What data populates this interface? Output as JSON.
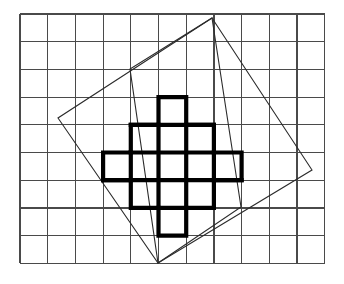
{
  "figure": {
    "background_color": "#ffffff",
    "width": 344,
    "height": 284
  },
  "grid": {
    "label": "square-lattice-grid",
    "color": "#4a4a4a",
    "stroke_width": 1.2,
    "x_start": 20,
    "y_start": 14,
    "cell_size": 27.7,
    "columns": 11,
    "rows": 9,
    "x_lines": [
      20,
      47.7,
      75.4,
      103.1,
      130.8,
      158.5,
      186.2,
      213.9,
      241.6,
      269.3,
      297.0,
      324.7
    ],
    "y_lines": [
      14,
      41.7,
      69.4,
      97.1,
      124.8,
      152.5,
      180.2,
      207.9,
      235.6,
      263.3
    ]
  },
  "outer_square": {
    "label": "large-rotated-square",
    "color": "#2b2b2b",
    "stroke_width": 1.1,
    "vertices": [
      {
        "name": "top",
        "x": 212,
        "y": 18
      },
      {
        "name": "right",
        "x": 312,
        "y": 170
      },
      {
        "name": "bottom",
        "x": 158,
        "y": 263
      },
      {
        "name": "left",
        "x": 58,
        "y": 118
      }
    ],
    "points_attr": "212,18 312,170 158,263 58,118"
  },
  "inner_square": {
    "label": "small-rotated-square",
    "color": "#2b2b2b",
    "stroke_width": 1.1,
    "vertices": [
      {
        "name": "top",
        "x": 212,
        "y": 18
      },
      {
        "name": "right",
        "x": 241,
        "y": 207
      },
      {
        "name": "bottom",
        "x": 158,
        "y": 263
      },
      {
        "name": "left",
        "x": 130,
        "y": 69
      }
    ],
    "points_attr": "212,18 241,207 158,263 130,69"
  },
  "cross_shape": {
    "label": "stepped-cross-aztec-diamond",
    "color": "#000000",
    "stroke_width": 4.2,
    "description": "Stepped diamond of unit cells arranged 1-3-5-3-1 across five rows",
    "row_cell_counts": [
      1,
      3,
      5,
      3,
      1
    ],
    "origin": {
      "x": 103.1,
      "y": 97.1
    },
    "cell_size": 27.7,
    "outline_points": "158.5,97.1 186.2,97.1 186.2,124.8 213.9,124.8 213.9,152.5 241.6,152.5 241.6,180.2 213.9,180.2 213.9,207.9 186.2,207.9 186.2,235.6 158.5,235.6 158.5,207.9 130.8,207.9 130.8,180.2 103.1,180.2 103.1,152.5 130.8,152.5 130.8,124.8 158.5,124.8",
    "interior_segments": [
      {
        "x1": 130.8,
        "y1": 152.5,
        "x2": 213.9,
        "y2": 152.5
      },
      {
        "x1": 103.1,
        "y1": 180.2,
        "x2": 241.6,
        "y2": 180.2
      },
      {
        "x1": 130.8,
        "y1": 124.8,
        "x2": 213.9,
        "y2": 124.8
      },
      {
        "x1": 158.5,
        "y1": 207.9,
        "x2": 186.2,
        "y2": 207.9
      },
      {
        "x1": 158.5,
        "y1": 124.8,
        "x2": 158.5,
        "y2": 207.9
      },
      {
        "x1": 186.2,
        "y1": 124.8,
        "x2": 186.2,
        "y2": 207.9
      },
      {
        "x1": 130.8,
        "y1": 152.5,
        "x2": 130.8,
        "y2": 180.2
      },
      {
        "x1": 213.9,
        "y1": 152.5,
        "x2": 213.9,
        "y2": 180.2
      }
    ]
  }
}
